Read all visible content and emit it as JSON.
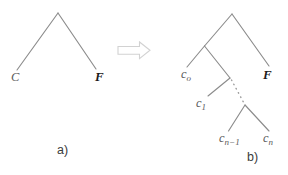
{
  "figure": {
    "width": 288,
    "height": 175,
    "background": "#ffffff",
    "edge_color": "#8c8c8c",
    "label_color": "#5a5a5a",
    "label_strong_color": "#1b1b1b",
    "arrow_stroke_color": "#d2d2d2"
  },
  "panel_a": {
    "caption": "a)",
    "nodes": [
      {
        "name": "root",
        "x": 58,
        "y": 13,
        "label": ""
      },
      {
        "name": "leaf-c",
        "x": 18,
        "y": 70,
        "label": "C"
      },
      {
        "name": "leaf-f",
        "x": 95,
        "y": 70,
        "label": "F"
      }
    ],
    "labels": {
      "c": "C",
      "f": "F"
    }
  },
  "transform_arrow": {
    "name": "rightwards-block-arrow",
    "glyph": "⇒",
    "x": 118,
    "y": 42,
    "width": 32,
    "height": 17
  },
  "panel_b": {
    "caption": "b)",
    "nodes": [
      {
        "name": "root",
        "x": 232,
        "y": 14
      },
      {
        "name": "internal-1",
        "x": 205,
        "y": 46
      },
      {
        "name": "internal-2",
        "x": 230,
        "y": 78
      },
      {
        "name": "internal-3",
        "x": 245,
        "y": 105
      }
    ],
    "labels": {
      "c0_base": "c",
      "c0_sub": "o",
      "c1_base": "c",
      "c1_sub": "1",
      "cn1_base": "c",
      "cn1_sub": "n−1",
      "cn_base": "c",
      "cn_sub": "n",
      "f": "F",
      "ellipsis": "⋯"
    }
  }
}
